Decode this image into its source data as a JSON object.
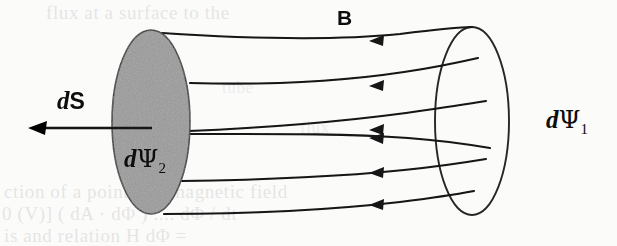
{
  "figure": {
    "kind": "magnetic-flux-tube-diagram",
    "width": 617,
    "height": 246,
    "background_color": "#fbfbfa",
    "ink_color": "#1a1a1a",
    "cap_fill_color": "#9a9a9a",
    "labels": {
      "field_vector": "B",
      "surface_element_d": "d",
      "surface_element_s": "S",
      "flux_near_d": "d",
      "flux_near_psi": "Ψ",
      "flux_near_sub": "2",
      "flux_far_d": "d",
      "flux_far_psi": "Ψ",
      "flux_far_sub": "1"
    },
    "ghost_text": {
      "top": "flux at  a  surface  to  the",
      "bottom_1": "ction  of  a  point  in  a  magnetic  field",
      "bottom_2": "0  (V)]   (  dA · dΦ )   ....   dΦ / dt",
      "bottom_3": "is      and      relation  H    dΦ =  ",
      "mid_1": "tube",
      "mid_2": "flux"
    },
    "geometry": {
      "near_cap": {
        "cx": 151,
        "cy": 122,
        "rx": 39,
        "ry": 92,
        "filled": true
      },
      "far_cap": {
        "cx": 472,
        "cy": 121,
        "rx": 37,
        "ry": 94,
        "filled": false
      },
      "ds_arrow": {
        "x_start": 152,
        "x_end": 31,
        "y": 128,
        "direction": "left"
      },
      "field_line_count": 6,
      "arrowhead_x": 376,
      "arrow_direction": "left"
    }
  }
}
